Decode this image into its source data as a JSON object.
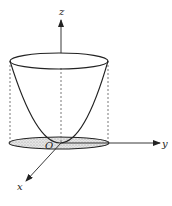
{
  "diagram": {
    "type": "3d-coordinate-figure",
    "labels": {
      "z_axis": "z",
      "y_axis": "y",
      "x_axis": "x",
      "origin": "O"
    },
    "colors": {
      "stroke": "#222222",
      "dashed": "#555555",
      "fill_region": "#d9d9d9"
    }
  }
}
